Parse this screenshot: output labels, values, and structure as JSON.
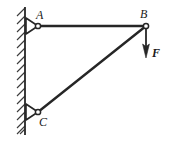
{
  "figure": {
    "type": "statics-free-body-diagram",
    "width": 169,
    "height": 141,
    "background_color": "#ffffff",
    "line_color": "#262626",
    "hatch_color": "#3a3a3a"
  },
  "labels": {
    "point_a": "A",
    "point_b": "B",
    "point_c": "C",
    "force": "F"
  },
  "geometry": {
    "wall": {
      "x": 25,
      "y_top": 8,
      "y_bottom": 134,
      "hatch_side": "left",
      "hatch_count": 16
    },
    "joints": [
      {
        "name": "A",
        "x": 38,
        "y": 26,
        "support": "pin"
      },
      {
        "name": "B",
        "x": 146,
        "y": 26,
        "support": "none"
      },
      {
        "name": "C",
        "x": 38,
        "y": 112,
        "support": "pin"
      }
    ],
    "members": [
      {
        "name": "AB",
        "from": "A",
        "to": "B",
        "orientation": "horizontal"
      },
      {
        "name": "CB",
        "from": "C",
        "to": "B",
        "orientation": "diagonal"
      }
    ],
    "force_arrow": {
      "name": "F",
      "x": 146,
      "y_start": 28,
      "y_end": 58,
      "direction": "down"
    }
  }
}
